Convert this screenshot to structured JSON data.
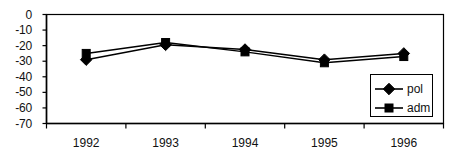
{
  "chart_data": {
    "type": "line",
    "title": "",
    "xlabel": "",
    "ylabel": "",
    "categories": [
      "1992",
      "1993",
      "1994",
      "1995",
      "1996"
    ],
    "series": [
      {
        "name": "pol",
        "marker": "diamond",
        "values": [
          -29,
          -19.5,
          -22.5,
          -29,
          -25
        ]
      },
      {
        "name": "adm",
        "marker": "square",
        "values": [
          -25,
          -18,
          -24,
          -31,
          -27
        ]
      }
    ],
    "ylim": [
      -70,
      0
    ],
    "yticks": [
      0,
      -10,
      -20,
      -30,
      -40,
      -50,
      -60,
      -70
    ],
    "ytick_labels": [
      "0",
      "-10",
      "-20",
      "-30",
      "-40",
      "-50",
      "-60",
      "-70"
    ],
    "grid": false,
    "legend_position": "bottom-right",
    "axis_color": "#000000",
    "series_color": "#000000"
  },
  "legend": {
    "entries": [
      {
        "label": "pol",
        "marker": "diamond"
      },
      {
        "label": "adm",
        "marker": "square"
      }
    ]
  }
}
